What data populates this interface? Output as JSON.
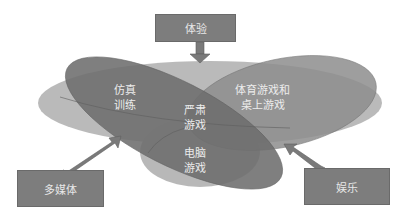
{
  "diagram": {
    "top_box": {
      "label": "体验"
    },
    "left_box": {
      "label": "多媒体"
    },
    "right_box": {
      "label": "娱乐"
    },
    "regions": [
      {
        "id": "simulation-training",
        "label_line1": "仿真",
        "label_line2": "训练"
      },
      {
        "id": "serious-games",
        "label_line1": "严肃",
        "label_line2": "游戏"
      },
      {
        "id": "sports-and-board-games",
        "label_line1": "体育游戏和",
        "label_line2": "桌上游戏"
      },
      {
        "id": "computer-games",
        "label_line1": "电脑",
        "label_line2": "游戏"
      }
    ],
    "colors": {
      "box_fill": "#7d7d7d",
      "dark_ellipse": "#6f6f6f",
      "mid_ellipse": "#8c8c8c",
      "light_ellipse": "#b4b4b4",
      "arrow": "#7a7a7a"
    }
  }
}
